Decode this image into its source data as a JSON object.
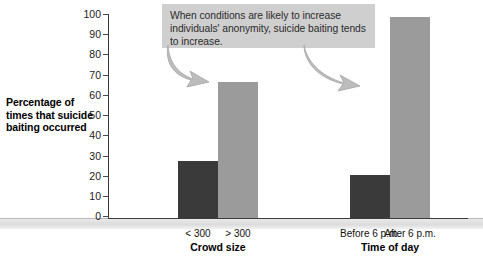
{
  "chart_data": {
    "type": "bar",
    "title": "",
    "subtitle": "",
    "xlabel": "",
    "ylabel": "Percentage of times that suicide baiting occurred",
    "ylim": [
      0,
      100
    ],
    "yticks": [
      0,
      10,
      20,
      30,
      40,
      50,
      60,
      70,
      80,
      90,
      100
    ],
    "grid": false,
    "legend": "none",
    "categories": [
      "< 300",
      "> 300",
      "Before 6 p.m.",
      "After 6 p.m."
    ],
    "values": [
      28,
      67,
      21,
      99
    ],
    "bar_colors": [
      "#3a3a3a",
      "#9b9b9b",
      "#3a3a3a",
      "#9b9b9b"
    ],
    "groups": [
      {
        "name": "Crowd size",
        "categories": [
          "< 300",
          "> 300"
        ],
        "values": [
          28,
          67
        ]
      },
      {
        "name": "Time of day",
        "categories": [
          "Before 6 p.m.",
          "After 6 p.m."
        ],
        "values": [
          21,
          99
        ]
      }
    ],
    "annotations": [
      "When conditions are likely to increase individuals' anonymity, suicide baiting tends to increase."
    ]
  },
  "axis": {
    "y_title": "Percentage of times that suicide baiting occurred",
    "ticks": [
      "100",
      "90",
      "80",
      "70",
      "60",
      "50",
      "40",
      "30",
      "20",
      "10",
      "0"
    ]
  },
  "groups": [
    {
      "label": "Crowd size",
      "bars": [
        {
          "label": "< 300",
          "value": 28,
          "color": "#3a3a3a"
        },
        {
          "label": "> 300",
          "value": 67,
          "color": "#9b9b9b"
        }
      ]
    },
    {
      "label": "Time of day",
      "bars": [
        {
          "label": "Before 6 p.m.",
          "value": 21,
          "color": "#3a3a3a"
        },
        {
          "label": "After 6 p.m.",
          "value": 99,
          "color": "#9b9b9b"
        }
      ]
    }
  ],
  "callout": {
    "text": "When conditions are likely to increase individuals' anonymity, suicide baiting tends to increase."
  },
  "colors": {
    "dark_bar": "#3a3a3a",
    "light_bar": "#9b9b9b",
    "callout_background": "#cfcfcf",
    "arrow": "#b0b0b0",
    "axis": "#3c3c3c"
  }
}
